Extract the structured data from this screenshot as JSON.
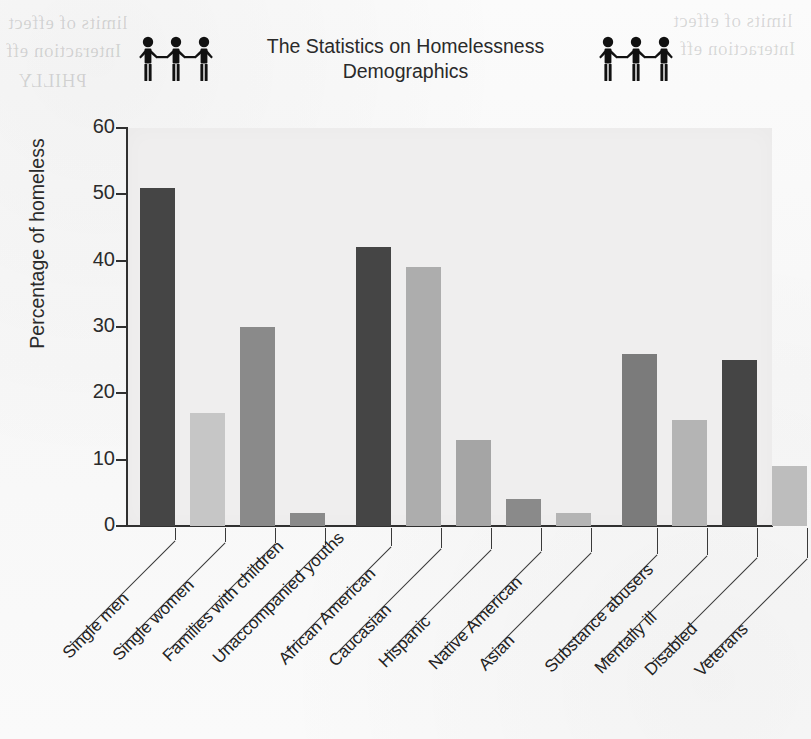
{
  "header": {
    "title": "The Statistics on Homelessness Demographics",
    "left_icon": "people-holding-hands-icon",
    "right_icon": "people-holding-hands-icon"
  },
  "colors": {
    "bar_dark": "#454545",
    "bar_medium": "#8a8a8a",
    "bar_light": "#c6c6c6",
    "plot_background": "#efeeee",
    "axis": "#303030",
    "text": "#2b2b2b"
  },
  "chart_data": {
    "type": "bar",
    "title": "The Statistics on Homelessness Demographics",
    "xlabel": "",
    "ylabel": "Percentage of homeless",
    "ylim": [
      0,
      60
    ],
    "yticks": [
      0,
      10,
      20,
      30,
      40,
      50,
      60
    ],
    "grid": false,
    "legend": "none",
    "categories": [
      "Single men",
      "Single women",
      "Families with children",
      "Unaccompanied youths",
      "African American",
      "Caucasian",
      "Hispanic",
      "Native American",
      "Asian",
      "Substance abusers",
      "Mentally ill",
      "Disabled",
      "Veterans"
    ],
    "values": [
      51,
      17,
      30,
      2,
      42,
      39,
      13,
      4,
      2,
      26,
      16,
      25,
      9
    ],
    "bar_colors": [
      "#454545",
      "#c6c6c6",
      "#8a8a8a",
      "#8a8a8a",
      "#454545",
      "#adadad",
      "#a5a5a5",
      "#8a8a8a",
      "#b4b4b4",
      "#7b7b7b",
      "#b4b4b4",
      "#454545",
      "#bdbdbd"
    ],
    "groups": [
      {
        "name": "household",
        "start": 0,
        "count": 4
      },
      {
        "name": "ethnicity",
        "start": 4,
        "count": 5
      },
      {
        "name": "condition",
        "start": 9,
        "count": 4
      }
    ]
  },
  "scan_bleed": {
    "lines": [
      "limits of effect",
      "Interaction eff",
      "PHILLY"
    ]
  }
}
